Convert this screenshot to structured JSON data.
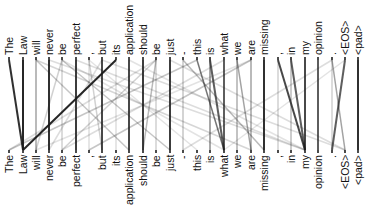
{
  "diagram": {
    "type": "attention-visualization",
    "line_color": "#1a1a1a",
    "top_tokens": [
      "The",
      "Law",
      "will",
      "never",
      "be",
      "perfect",
      ",",
      "but",
      "its",
      "application",
      "should",
      "be",
      "just",
      "-",
      "this",
      "is",
      "what",
      "we",
      "are",
      "missing",
      ",",
      "in",
      "my",
      "opinion",
      ".",
      "<EOS>",
      "<pad>"
    ],
    "bottom_tokens": [
      "The",
      "Law",
      "will",
      "never",
      "be",
      "perfect",
      ",",
      "but",
      "its",
      "application",
      "should",
      "be",
      "just",
      "-",
      "this",
      "is",
      "what",
      "we",
      "are",
      "missing",
      ",",
      "in",
      "my",
      "opinion",
      ".",
      "<EOS>",
      "<pad>"
    ],
    "x_positions": [
      9,
      23,
      36,
      49,
      62,
      76,
      89,
      102,
      116,
      129,
      143,
      156,
      170,
      183,
      197,
      210,
      224,
      237,
      251,
      264,
      278,
      291,
      305,
      318,
      332,
      345,
      358
    ],
    "top_line_y": 60,
    "bottom_line_y": 150,
    "links": [
      {
        "from": 0,
        "to": 1,
        "w": 0.9
      },
      {
        "from": 1,
        "to": 1,
        "w": 0.95
      },
      {
        "from": 8,
        "to": 1,
        "w": 0.95
      },
      {
        "from": 2,
        "to": 2,
        "w": 0.4
      },
      {
        "from": 2,
        "to": 9,
        "w": 0.25
      },
      {
        "from": 3,
        "to": 3,
        "w": 0.9
      },
      {
        "from": 4,
        "to": 2,
        "w": 0.2
      },
      {
        "from": 4,
        "to": 12,
        "w": 0.25
      },
      {
        "from": 5,
        "to": 5,
        "w": 0.85
      },
      {
        "from": 6,
        "to": 7,
        "w": 0.2
      },
      {
        "from": 7,
        "to": 7,
        "w": 0.8
      },
      {
        "from": 7,
        "to": 3,
        "w": 0.15
      },
      {
        "from": 9,
        "to": 9,
        "w": 0.8
      },
      {
        "from": 10,
        "to": 10,
        "w": 0.85
      },
      {
        "from": 11,
        "to": 10,
        "w": 0.3
      },
      {
        "from": 11,
        "to": 4,
        "w": 0.2
      },
      {
        "from": 12,
        "to": 12,
        "w": 0.85
      },
      {
        "from": 13,
        "to": 19,
        "w": 0.3
      },
      {
        "from": 14,
        "to": 16,
        "w": 0.6
      },
      {
        "from": 14,
        "to": 0,
        "w": 0.25
      },
      {
        "from": 15,
        "to": 16,
        "w": 0.7
      },
      {
        "from": 16,
        "to": 16,
        "w": 0.7
      },
      {
        "from": 17,
        "to": 18,
        "w": 0.4
      },
      {
        "from": 18,
        "to": 6,
        "w": 0.25
      },
      {
        "from": 19,
        "to": 19,
        "w": 0.9
      },
      {
        "from": 20,
        "to": 22,
        "w": 0.8
      },
      {
        "from": 21,
        "to": 22,
        "w": 0.7
      },
      {
        "from": 22,
        "to": 22,
        "w": 0.8
      },
      {
        "from": 23,
        "to": 23,
        "w": 0.7
      },
      {
        "from": 24,
        "to": 25,
        "w": 0.4
      },
      {
        "from": 25,
        "to": 24,
        "w": 0.7
      },
      {
        "from": 26,
        "to": 26,
        "w": 0.9
      },
      {
        "from": 2,
        "to": 18,
        "w": 0.18
      },
      {
        "from": 3,
        "to": 22,
        "w": 0.15
      },
      {
        "from": 5,
        "to": 22,
        "w": 0.15
      },
      {
        "from": 7,
        "to": 25,
        "w": 0.15
      },
      {
        "from": 9,
        "to": 22,
        "w": 0.12
      },
      {
        "from": 12,
        "to": 25,
        "w": 0.15
      },
      {
        "from": 4,
        "to": 16,
        "w": 0.12
      },
      {
        "from": 11,
        "to": 0,
        "w": 0.15
      },
      {
        "from": 16,
        "to": 4,
        "w": 0.15
      },
      {
        "from": 18,
        "to": 2,
        "w": 0.12
      },
      {
        "from": 24,
        "to": 13,
        "w": 0.15
      },
      {
        "from": 25,
        "to": 16,
        "w": 0.12
      },
      {
        "from": 6,
        "to": 14,
        "w": 0.12
      },
      {
        "from": 13,
        "to": 13,
        "w": 0.25
      },
      {
        "from": 15,
        "to": 15,
        "w": 0.5
      },
      {
        "from": 17,
        "to": 17,
        "w": 0.35
      },
      {
        "from": 18,
        "to": 18,
        "w": 0.4
      },
      {
        "from": 20,
        "to": 20,
        "w": 0.2
      },
      {
        "from": 21,
        "to": 21,
        "w": 0.3
      },
      {
        "from": 24,
        "to": 24,
        "w": 0.2
      },
      {
        "from": 4,
        "to": 4,
        "w": 0.2
      },
      {
        "from": 6,
        "to": 6,
        "w": 0.15
      },
      {
        "from": 8,
        "to": 8,
        "w": 0.15
      },
      {
        "from": 11,
        "to": 11,
        "w": 0.2
      }
    ]
  }
}
